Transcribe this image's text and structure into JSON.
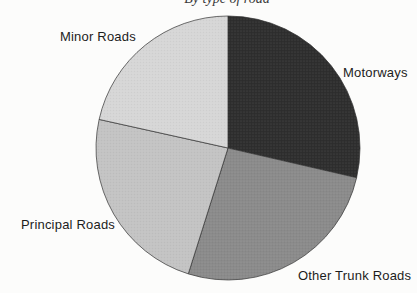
{
  "chart_data": {
    "type": "pie",
    "title": "By type of road",
    "slices": [
      {
        "label": "Motorways",
        "start_angle_deg": 0,
        "end_angle_deg": 103,
        "percent": 28.6,
        "color": "#2e2e2e"
      },
      {
        "label": "Other Trunk Roads",
        "start_angle_deg": 103,
        "end_angle_deg": 197.5,
        "percent": 26.3,
        "color": "#8a8a8a"
      },
      {
        "label": "Principal Roads",
        "start_angle_deg": 197.5,
        "end_angle_deg": 282.5,
        "percent": 23.6,
        "color": "#c3c3c3"
      },
      {
        "label": "Minor Roads",
        "start_angle_deg": 282.5,
        "end_angle_deg": 360,
        "percent": 21.5,
        "color": "#d6d6d6"
      }
    ],
    "slice_stroke": "#2f2f2f",
    "legend_position": "labels-around-pie",
    "background": "#fcfcfb"
  }
}
